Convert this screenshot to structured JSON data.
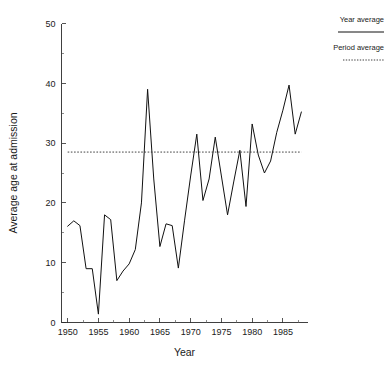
{
  "chart_data": {
    "type": "line",
    "title": "",
    "xlabel": "Year",
    "ylabel": "Average age at admission",
    "xlim": [
      1949,
      1989
    ],
    "ylim": [
      0,
      50
    ],
    "grid": false,
    "xticks": [
      1950,
      1955,
      1960,
      1965,
      1970,
      1975,
      1980,
      1985
    ],
    "yticks": [
      0,
      10,
      20,
      30,
      40,
      50
    ],
    "xminorticks": [
      1952.5,
      1957.5,
      1962.5,
      1967.5,
      1972.5,
      1977.5,
      1982.5,
      1987.5
    ],
    "yminorticks": [
      5,
      15,
      25,
      35,
      45
    ],
    "legend": {
      "position": "outside-right-top",
      "entries": [
        {
          "label": "Year average",
          "style": "solid"
        },
        {
          "label": "Period average",
          "style": "dotted"
        }
      ]
    },
    "series": [
      {
        "name": "Year average",
        "style": "solid",
        "x": [
          1950,
          1951,
          1952,
          1953,
          1954,
          1955,
          1956,
          1957,
          1958,
          1959,
          1960,
          1961,
          1962,
          1963,
          1964,
          1965,
          1966,
          1967,
          1968,
          1969,
          1970,
          1971,
          1972,
          1973,
          1974,
          1975,
          1976,
          1977,
          1978,
          1979,
          1980,
          1981,
          1982,
          1983,
          1984,
          1985,
          1986,
          1987,
          1988
        ],
        "y": [
          16.1,
          17.0,
          16.2,
          9.0,
          9.0,
          1.4,
          18.0,
          17.2,
          7.0,
          8.6,
          9.8,
          12.2,
          20.0,
          39.0,
          24.0,
          12.7,
          16.5,
          16.2,
          9.1,
          17.0,
          24.5,
          31.5,
          20.4,
          24.0,
          31.0,
          24.5,
          18.0,
          23.5,
          28.8,
          19.4,
          33.2,
          28.0,
          25.0,
          27.0,
          31.8,
          35.5,
          39.7,
          31.5,
          35.2
        ]
      },
      {
        "name": "Period average",
        "style": "dotted",
        "value": 28.5,
        "x_start": 1950,
        "x_end": 1988
      }
    ]
  },
  "axes": {
    "x_axis_label": "Year",
    "y_axis_label": "Average age at admission",
    "x_tick_labels": [
      "1950",
      "1955",
      "1960",
      "1965",
      "1970",
      "1975",
      "1980",
      "1985"
    ],
    "y_tick_labels": [
      "0",
      "10",
      "20",
      "30",
      "40",
      "50"
    ]
  },
  "legend": {
    "year_average_label": "Year average",
    "period_average_label": "Period average"
  },
  "colors": {
    "series_line": "#111111",
    "average_line": "#2b2b2b",
    "axis": "#2b2b2b",
    "background": "#ffffff",
    "text": "#1a1a1a"
  }
}
